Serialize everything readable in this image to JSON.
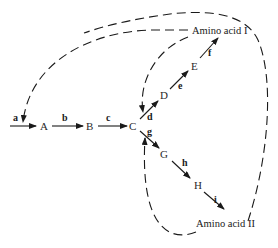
{
  "diagram": {
    "type": "metabolic-pathway-feedback-inhibition",
    "colors": {
      "ink": "#1a1a1a",
      "background": "#ffffff"
    },
    "nodes": {
      "A": "A",
      "B": "B",
      "C": "C",
      "D": "D",
      "E": "E",
      "G": "G",
      "H": "H",
      "product1": "Amino acid I",
      "product2": "Amino acid II"
    },
    "enzymes": {
      "a": "a",
      "b": "b",
      "c": "c",
      "d": "d",
      "e": "e",
      "f": "f",
      "g": "g",
      "h": "h",
      "i": "i"
    },
    "edges": [
      {
        "from": "start",
        "to": "A",
        "enzyme": "a"
      },
      {
        "from": "A",
        "to": "B",
        "enzyme": "b"
      },
      {
        "from": "B",
        "to": "C",
        "enzyme": "c"
      },
      {
        "from": "C",
        "to": "D",
        "enzyme": "d"
      },
      {
        "from": "D",
        "to": "E",
        "enzyme": "e"
      },
      {
        "from": "E",
        "to": "Amino acid I",
        "enzyme": "f"
      },
      {
        "from": "C",
        "to": "G",
        "enzyme": "g"
      },
      {
        "from": "G",
        "to": "H",
        "enzyme": "h"
      },
      {
        "from": "H",
        "to": "Amino acid II",
        "enzyme": "i"
      }
    ],
    "feedback": [
      {
        "from": "Amino acid I",
        "inhibits": "a"
      },
      {
        "from": "Amino acid I",
        "inhibits": "d"
      },
      {
        "from": "Amino acid II",
        "inhibits": "g"
      },
      {
        "from": "Amino acid II",
        "inhibits": "a"
      }
    ]
  }
}
